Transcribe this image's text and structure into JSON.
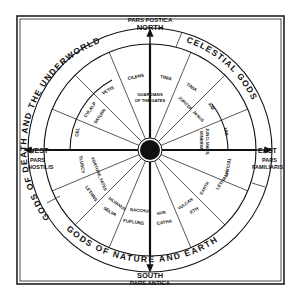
{
  "diagram": {
    "compass": {
      "north": {
        "direction": "NORTH",
        "region": "PARS POSTICA"
      },
      "south": {
        "direction": "SOUTH",
        "region": "PARS ANTICA"
      },
      "west": {
        "direction": "WEST",
        "region_line1": "PARS",
        "region_line2": "HOSTILIS"
      },
      "east": {
        "direction": "EAST",
        "region_line1": "PARS",
        "region_line2": "FAMILIARIS"
      }
    },
    "outer_ring": {
      "death": "GODS OF DEATH AND THE UNDERWORLD",
      "celestial": "CELESTIAL GODS",
      "nature": "GODS OF NATURE AND EARTH"
    },
    "inner_ring_labels": {
      "cel": "CEL",
      "cvlalp": "CVLALP",
      "vetis": "VETIS",
      "cilens": "CILENS",
      "tinia_top": "TINIA",
      "tinia_right": "TINIA",
      "ani": "ANI",
      "uni": "UNI",
      "tecum": "TECUM",
      "letham": "LETHAM",
      "eth": "ETH",
      "catha": "CATHA",
      "fufluns": "FUFLUNS",
      "selva": "SELVA",
      "lethns": "LETHNS",
      "tlusch": "TLUSCV"
    },
    "mid_ring_labels": {
      "saturn": "SATURN",
      "guardians_1": "GUARDIANS",
      "guardians_2": "OF THE GATES",
      "jupiter": "JUPITER, JANUS",
      "juno": "JUNO, MARS,",
      "minerva": "MINERVA",
      "earth": "EARTH",
      "vulcan": "VULCAN",
      "sun": "SUN",
      "bacchus": "BACCHUS",
      "silvanus": "SILVANUS",
      "fortune": "FORTUNE, FATES"
    }
  }
}
